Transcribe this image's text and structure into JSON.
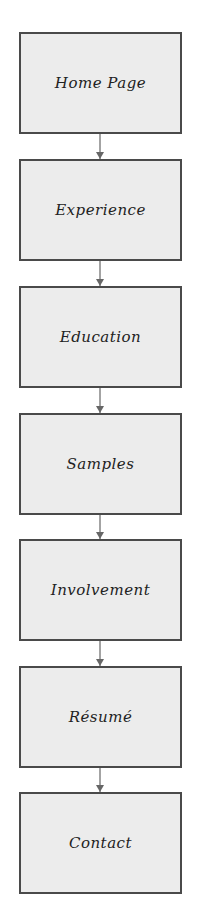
{
  "diagram": {
    "type": "flowchart",
    "direction": "top-to-bottom",
    "colors": {
      "node_fill": "#ececec",
      "node_border": "#4a4a4a",
      "arrow": "#666666",
      "text": "#222222",
      "background": "#ffffff"
    },
    "nodes": [
      {
        "id": "home",
        "label": "Home Page"
      },
      {
        "id": "experience",
        "label": "Experience"
      },
      {
        "id": "education",
        "label": "Education"
      },
      {
        "id": "samples",
        "label": "Samples"
      },
      {
        "id": "involvement",
        "label": "Involvement"
      },
      {
        "id": "resume",
        "label": "Résumé"
      },
      {
        "id": "contact",
        "label": "Contact"
      }
    ],
    "edges": [
      {
        "from": "home",
        "to": "experience"
      },
      {
        "from": "experience",
        "to": "education"
      },
      {
        "from": "education",
        "to": "samples"
      },
      {
        "from": "samples",
        "to": "involvement"
      },
      {
        "from": "involvement",
        "to": "resume"
      },
      {
        "from": "resume",
        "to": "contact"
      }
    ]
  }
}
